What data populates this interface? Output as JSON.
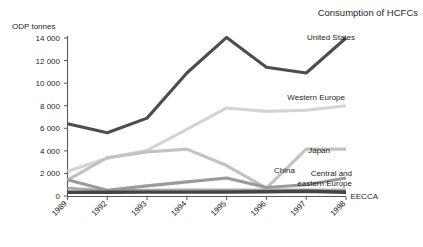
{
  "chart_data": {
    "type": "line",
    "title": "Consumption of HCFCs",
    "xlabel": "",
    "ylabel": "ODP tonnes",
    "categories": [
      "1989",
      "1992",
      "1993",
      "1994",
      "1995",
      "1996",
      "1997",
      "1998"
    ],
    "ylim": [
      0,
      14000
    ],
    "ytick_labels": [
      "0",
      "2 000",
      "4 000",
      "6 000",
      "8 000",
      "10 000",
      "12 000",
      "14 000"
    ],
    "ytick_values": [
      0,
      2000,
      4000,
      6000,
      8000,
      10000,
      12000,
      14000
    ],
    "grid": false,
    "legend_position": "right-inline-labels",
    "series": [
      {
        "name": "United States",
        "color": "#4d4d4d",
        "width": 3.1,
        "values": [
          6400,
          5600,
          6900,
          10900,
          14050,
          11400,
          10900,
          14000
        ],
        "label_x": 355,
        "label_y": 40
      },
      {
        "name": "Western Europe",
        "color": "#d4d4d4",
        "width": 3.1,
        "values": [
          2200,
          3350,
          4050,
          5900,
          7800,
          7500,
          7600,
          8000
        ],
        "label_x": 345,
        "label_y": 100
      },
      {
        "name": "Japan",
        "color": "#c2c2c2",
        "width": 3.1,
        "values": [
          1400,
          3400,
          3900,
          4150,
          2700,
          700,
          4150,
          4150
        ],
        "label_x": 330,
        "label_y": 153
      },
      {
        "name": "China",
        "color": "#9a9a9a",
        "width": 3.1,
        "values": [
          1450,
          500,
          900,
          1250,
          1600,
          750,
          1000,
          1600
        ],
        "label_x": 295,
        "label_y": 173
      },
      {
        "name": "Central and eastern Europe",
        "color": "#a8a8a8",
        "width": 2.6,
        "values": [
          700,
          480,
          520,
          560,
          560,
          560,
          560,
          520
        ],
        "label_line_1": "Central and",
        "label_line_2": "eastern Europe",
        "label_x": 352,
        "label_y": 176
      },
      {
        "name": "EECCA",
        "color": "#444444",
        "width": 3.4,
        "values": [
          330,
          330,
          340,
          340,
          350,
          380,
          420,
          330
        ],
        "label_x": 378,
        "label_y": 199
      }
    ]
  }
}
